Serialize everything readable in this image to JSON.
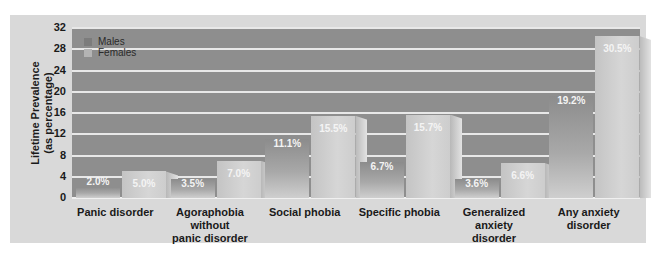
{
  "chart_data": {
    "type": "bar",
    "title": "",
    "xlabel": "",
    "ylabel": "Lifetime Prevalence (as percentage)",
    "ylabel_lines": [
      "Lifetime Prevalence",
      "(as percentage)"
    ],
    "ylim": [
      0,
      32
    ],
    "yticks": [
      0,
      4,
      8,
      12,
      16,
      20,
      24,
      28,
      32
    ],
    "grid": true,
    "legend_position": "upper-left",
    "categories": [
      "Panic disorder",
      "Agoraphobia without panic disorder",
      "Social phobia",
      "Specific phobia",
      "Generalized anxiety disorder",
      "Any anxiety disorder"
    ],
    "category_lines": [
      [
        "Panic disorder"
      ],
      [
        "Agoraphobia",
        "without",
        "panic disorder"
      ],
      [
        "Social phobia"
      ],
      [
        "Specific phobia"
      ],
      [
        "Generalized",
        "anxiety",
        "disorder"
      ],
      [
        "Any anxiety",
        "disorder"
      ]
    ],
    "series": [
      {
        "name": "Males",
        "values": [
          2.0,
          3.5,
          11.1,
          6.7,
          3.6,
          19.2
        ],
        "labels": [
          "2.0%",
          "3.5%",
          "11.1%",
          "6.7%",
          "3.6%",
          "19.2%"
        ],
        "color": "#8a8a8a"
      },
      {
        "name": "Females",
        "values": [
          5.0,
          7.0,
          15.5,
          15.7,
          6.6,
          30.5
        ],
        "labels": [
          "5.0%",
          "7.0%",
          "15.5%",
          "15.7%",
          "6.6%",
          "30.5%"
        ],
        "color": "#c8c8c8"
      }
    ]
  },
  "legend": {
    "males": "Males",
    "females": "Females"
  },
  "yticks_text": [
    "32",
    "28",
    "24",
    "20",
    "16",
    "12",
    "8",
    "4",
    "0"
  ],
  "colors": {
    "panel": "#d9d9d9",
    "plot": "#8e8e8e",
    "grid": "#e8e8e8",
    "male_bar": "#9a9a9a",
    "female_bar": "#cfcfcf"
  }
}
